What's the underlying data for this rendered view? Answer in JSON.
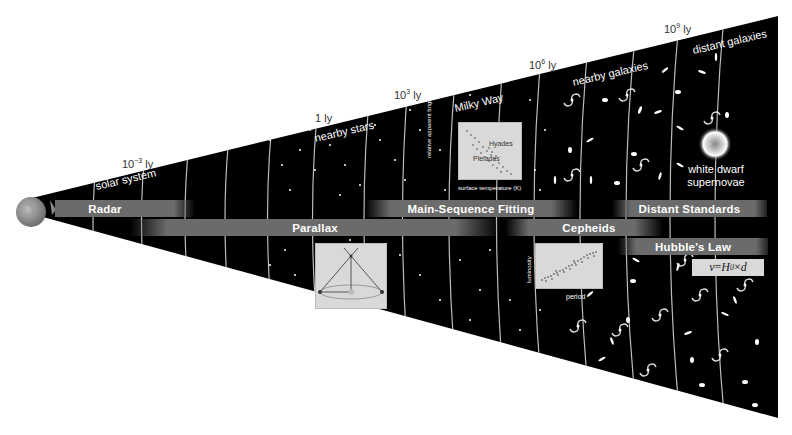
{
  "diagram": {
    "title_hint": "Cosmic distance ladder",
    "distance_markers": [
      {
        "base": "10",
        "exp": "−3",
        "unit": "ly"
      },
      {
        "base": "1",
        "exp": "",
        "unit": "ly"
      },
      {
        "base": "10",
        "exp": "3",
        "unit": "ly"
      },
      {
        "base": "10",
        "exp": "6",
        "unit": "ly"
      },
      {
        "base": "10",
        "exp": "9",
        "unit": "ly"
      }
    ],
    "regions": [
      {
        "label": "solar system"
      },
      {
        "label": "nearby stars"
      },
      {
        "label": "Milky Way"
      },
      {
        "label": "nearby galaxies"
      },
      {
        "label": "distant galaxies"
      }
    ],
    "methods": [
      {
        "label": "Radar",
        "color": "#6b6b6b"
      },
      {
        "label": "Parallax",
        "color": "#6b6b6b"
      },
      {
        "label": "Main-Sequence Fitting",
        "color": "#6b6b6b"
      },
      {
        "label": "Cepheids",
        "color": "#6b6b6b"
      },
      {
        "label": "Distant Standards",
        "color": "#6b6b6b"
      },
      {
        "label": "Hubble's Law",
        "color": "#6b6b6b"
      }
    ],
    "insets": {
      "hr_diagram": {
        "y_label": "relative apparent brightness",
        "x_label": "surface temperature (K)",
        "cluster_a": "Hyades",
        "cluster_b": "Pleiades"
      },
      "cepheid": {
        "y_label": "luminosity",
        "x_label": "period"
      },
      "standard_candle": {
        "line1": "white dwarf",
        "line2": "supernovae"
      },
      "hubble_formula": {
        "v": "v",
        "eq": " = ",
        "H": "H",
        "sub": "0",
        "times": " × ",
        "d": "d"
      }
    },
    "colors": {
      "space": "#000000",
      "bar": "#6b6b6b",
      "inset": "#d9d9d9",
      "arc": "#bdbdbd",
      "earth": "#8a8a8a"
    }
  }
}
